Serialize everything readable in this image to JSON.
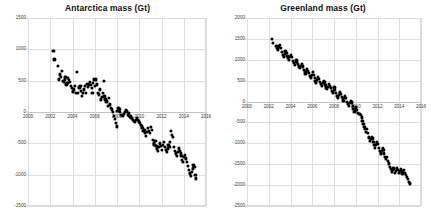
{
  "chart_data": [
    {
      "type": "scatter",
      "title": "Antarctica mass (Gt)",
      "xlabel": "",
      "ylabel": "",
      "xlim": [
        2000,
        2016
      ],
      "ylim": [
        -1500,
        1500
      ],
      "xticks": [
        2000,
        2002,
        2004,
        2006,
        2008,
        2010,
        2012,
        2014,
        2016
      ],
      "yticks": [
        1500,
        1000,
        500,
        0,
        -500,
        -1000,
        -1500
      ],
      "grid": true,
      "legend": "none",
      "marker_color": "#000000",
      "series": [
        {
          "name": "Antarctica ice mass anomaly",
          "x": [
            2002.29,
            2002.37,
            2002.71,
            2002.79,
            2002.87,
            2002.96,
            2003.04,
            2003.12,
            2003.21,
            2003.29,
            2003.37,
            2003.46,
            2003.54,
            2003.62,
            2003.71,
            2003.79,
            2003.87,
            2003.96,
            2004.04,
            2004.12,
            2004.21,
            2004.29,
            2004.37,
            2004.46,
            2004.54,
            2004.62,
            2004.71,
            2004.79,
            2004.87,
            2004.96,
            2005.04,
            2005.12,
            2005.21,
            2005.29,
            2005.37,
            2005.46,
            2005.54,
            2005.62,
            2005.71,
            2005.79,
            2005.87,
            2005.96,
            2006.04,
            2006.12,
            2006.21,
            2006.29,
            2006.37,
            2006.46,
            2006.54,
            2006.62,
            2006.71,
            2006.79,
            2006.87,
            2006.96,
            2007.04,
            2007.12,
            2007.21,
            2007.29,
            2007.37,
            2007.46,
            2007.54,
            2007.62,
            2007.71,
            2007.79,
            2007.87,
            2007.96,
            2008.04,
            2008.12,
            2008.21,
            2008.29,
            2008.37,
            2008.46,
            2008.54,
            2008.62,
            2008.71,
            2008.79,
            2008.87,
            2008.96,
            2009.04,
            2009.12,
            2009.21,
            2009.29,
            2009.37,
            2009.46,
            2009.54,
            2009.62,
            2009.71,
            2009.79,
            2009.87,
            2009.96,
            2010.04,
            2010.12,
            2010.21,
            2010.29,
            2010.37,
            2010.46,
            2010.54,
            2010.62,
            2010.71,
            2010.79,
            2010.87,
            2010.96,
            2011.04,
            2011.12,
            2011.21,
            2011.29,
            2011.37,
            2011.46,
            2011.54,
            2011.62,
            2011.71,
            2011.79,
            2011.87,
            2011.96,
            2012.04,
            2012.12,
            2012.21,
            2012.29,
            2012.37,
            2012.46,
            2012.54,
            2012.62,
            2012.71,
            2012.79,
            2012.87,
            2012.96,
            2013.04,
            2013.12,
            2013.21,
            2013.29,
            2013.37,
            2013.46,
            2013.54,
            2013.62,
            2013.71,
            2013.79,
            2013.87,
            2013.96,
            2014.04,
            2014.12,
            2014.21,
            2014.29,
            2014.37,
            2014.46,
            2014.54,
            2014.62,
            2014.71,
            2014.79,
            2014.87,
            2014.96,
            2015.04,
            2015.12
          ],
          "y": [
            980,
            840,
            730,
            520,
            600,
            560,
            660,
            500,
            480,
            520,
            560,
            440,
            470,
            540,
            510,
            480,
            420,
            390,
            330,
            360,
            420,
            300,
            640,
            300,
            400,
            380,
            420,
            340,
            260,
            300,
            360,
            420,
            300,
            450,
            400,
            440,
            480,
            430,
            380,
            300,
            470,
            520,
            420,
            520,
            440,
            300,
            280,
            360,
            200,
            240,
            310,
            500,
            250,
            200,
            160,
            180,
            100,
            230,
            120,
            60,
            40,
            0,
            -60,
            -110,
            -180,
            -230,
            20,
            60,
            40,
            0,
            -40,
            -50,
            -60,
            -30,
            0,
            30,
            10,
            -40,
            -20,
            -60,
            -70,
            -100,
            -90,
            -120,
            -140,
            -160,
            -130,
            -100,
            -120,
            -150,
            -180,
            -200,
            -230,
            -260,
            -300,
            -280,
            -340,
            -380,
            -320,
            -260,
            -300,
            -340,
            -240,
            -280,
            -440,
            -500,
            -520,
            -460,
            -540,
            -580,
            -620,
            -560,
            -500,
            -540,
            -600,
            -520,
            -480,
            -560,
            -600,
            -640,
            -580,
            -520,
            -560,
            -480,
            -300,
            -360,
            -400,
            -560,
            -620,
            -660,
            -700,
            -640,
            -580,
            -620,
            -660,
            -700,
            -760,
            -800,
            -720,
            -680,
            -740,
            -800,
            -860,
            -920,
            -980,
            -1020,
            -960,
            -900,
            -840,
            -880,
            -1000,
            -1060,
            -1100,
            -780,
            -820,
            -880
          ]
        }
      ]
    },
    {
      "type": "scatter",
      "title": "Greenland mass (Gt)",
      "xlabel": "",
      "ylabel": "",
      "xlim": [
        2000,
        2016
      ],
      "ylim": [
        -2500,
        2000
      ],
      "xticks": [
        2000,
        2002,
        2004,
        2006,
        2008,
        2010,
        2012,
        2014,
        2016
      ],
      "yticks": [
        2000,
        1500,
        1000,
        500,
        0,
        -500,
        -1000,
        -1500,
        -2000,
        -2500
      ],
      "grid": true,
      "legend": "none",
      "marker_color": "#000000",
      "series": [
        {
          "name": "Greenland ice mass anomaly",
          "x": [
            2002.29,
            2002.37,
            2002.71,
            2002.79,
            2002.87,
            2002.96,
            2003.04,
            2003.12,
            2003.21,
            2003.29,
            2003.37,
            2003.46,
            2003.54,
            2003.62,
            2003.71,
            2003.79,
            2003.87,
            2003.96,
            2004.04,
            2004.12,
            2004.21,
            2004.29,
            2004.37,
            2004.46,
            2004.54,
            2004.62,
            2004.71,
            2004.79,
            2004.87,
            2004.96,
            2005.04,
            2005.12,
            2005.21,
            2005.29,
            2005.37,
            2005.46,
            2005.54,
            2005.62,
            2005.71,
            2005.79,
            2005.87,
            2005.96,
            2006.04,
            2006.12,
            2006.21,
            2006.29,
            2006.37,
            2006.46,
            2006.54,
            2006.62,
            2006.71,
            2006.79,
            2006.87,
            2006.96,
            2007.04,
            2007.12,
            2007.21,
            2007.29,
            2007.37,
            2007.46,
            2007.54,
            2007.62,
            2007.71,
            2007.79,
            2007.87,
            2007.96,
            2008.04,
            2008.12,
            2008.21,
            2008.29,
            2008.37,
            2008.46,
            2008.54,
            2008.62,
            2008.71,
            2008.79,
            2008.87,
            2008.96,
            2009.04,
            2009.12,
            2009.21,
            2009.29,
            2009.37,
            2009.46,
            2009.54,
            2009.62,
            2009.71,
            2009.79,
            2009.87,
            2009.96,
            2010.04,
            2010.12,
            2010.21,
            2010.29,
            2010.37,
            2010.46,
            2010.54,
            2010.62,
            2010.71,
            2010.79,
            2010.87,
            2010.96,
            2011.04,
            2011.12,
            2011.21,
            2011.29,
            2011.37,
            2011.46,
            2011.54,
            2011.62,
            2011.71,
            2011.79,
            2011.87,
            2011.96,
            2012.04,
            2012.12,
            2012.21,
            2012.29,
            2012.37,
            2012.46,
            2012.54,
            2012.62,
            2012.71,
            2012.79,
            2012.87,
            2012.96,
            2013.04,
            2013.12,
            2013.21,
            2013.29,
            2013.37,
            2013.46,
            2013.54,
            2013.62,
            2013.71,
            2013.79,
            2013.87,
            2013.96,
            2014.04,
            2014.12,
            2014.21,
            2014.29,
            2014.37,
            2014.46,
            2014.54,
            2014.62,
            2014.71,
            2014.79,
            2014.87,
            2014.96
          ],
          "y": [
            1490,
            1400,
            1340,
            1280,
            1250,
            1320,
            1360,
            1280,
            1180,
            1120,
            1080,
            1140,
            1200,
            1160,
            1100,
            1040,
            1000,
            1060,
            1120,
            1060,
            980,
            920,
            880,
            940,
            1000,
            960,
            900,
            840,
            800,
            860,
            900,
            840,
            760,
            700,
            660,
            720,
            780,
            740,
            680,
            620,
            580,
            640,
            700,
            640,
            560,
            500,
            460,
            520,
            580,
            540,
            480,
            420,
            380,
            440,
            500,
            460,
            400,
            340,
            300,
            360,
            420,
            380,
            320,
            260,
            220,
            280,
            340,
            280,
            200,
            140,
            100,
            160,
            220,
            180,
            120,
            60,
            20,
            80,
            140,
            80,
            0,
            -60,
            -100,
            -40,
            20,
            -20,
            -100,
            -180,
            -240,
            -200,
            -140,
            -200,
            -280,
            -300,
            -290,
            -320,
            -380,
            -460,
            -540,
            -600,
            -660,
            -720,
            -660,
            -760,
            -860,
            -940,
            -900,
            -840,
            -880,
            -960,
            -1040,
            -1100,
            -1040,
            -980,
            -1020,
            -1100,
            -1180,
            -1240,
            -1180,
            -1120,
            -1160,
            -1240,
            -1320,
            -1380,
            -1320,
            -1420,
            -1480,
            -1560,
            -1620,
            -1680,
            -1640,
            -1580,
            -1620,
            -1700,
            -1660,
            -1600,
            -1640,
            -1700,
            -1660,
            -1620,
            -1660,
            -1720,
            -1680,
            -1640,
            -1700,
            -1760,
            -1800,
            -1860,
            -1920,
            -1960,
            -1900,
            -1940,
            -1980
          ]
        }
      ]
    }
  ]
}
